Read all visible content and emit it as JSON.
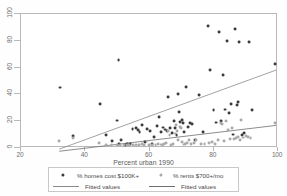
{
  "chart_data": {
    "type": "scatter",
    "title": "",
    "xlabel": "Percent urban 1990",
    "ylabel": "",
    "xlim": [
      20,
      100
    ],
    "ylim": [
      0,
      100
    ],
    "xticks": [
      "20",
      "40",
      "60",
      "80",
      "100"
    ],
    "yticks": [
      "0",
      "20",
      "40",
      "60",
      "80",
      "100"
    ],
    "grid": false,
    "legend_position": "bottom",
    "legend": [
      {
        "label": "% homes cost $100K+",
        "marker": "filled-circle",
        "color": "#3a3a3a"
      },
      {
        "label": "Fitted values",
        "marker": "line",
        "color": "#8a8a8a"
      },
      {
        "label": "% rents $700+/mo",
        "marker": "filled-circle",
        "color": "#a9a9a9"
      },
      {
        "label": "Fitted values",
        "marker": "line",
        "color": "#6f6f6f"
      }
    ],
    "series": [
      {
        "name": "% homes cost $100K+",
        "marker": "filled-circle",
        "color": "#3a3a3a",
        "points": [
          [
            32.2,
            44.3
          ],
          [
            36.2,
            7.6
          ],
          [
            44.8,
            32.0
          ],
          [
            46.8,
            8.5
          ],
          [
            48.5,
            4.0
          ],
          [
            50.2,
            19.3
          ],
          [
            50.6,
            65.3
          ],
          [
            50.9,
            1.2
          ],
          [
            51.4,
            4.6
          ],
          [
            52.6,
            1.0
          ],
          [
            53.4,
            1.5
          ],
          [
            54.2,
            1.2
          ],
          [
            55.0,
            12.6
          ],
          [
            56.0,
            13.9
          ],
          [
            56.6,
            11.9
          ],
          [
            57.2,
            10.6
          ],
          [
            58.1,
            15.8
          ],
          [
            58.8,
            3.0
          ],
          [
            59.6,
            13.1
          ],
          [
            60.4,
            11.0
          ],
          [
            61.0,
            1.2
          ],
          [
            61.8,
            6.5
          ],
          [
            62.6,
            14.8
          ],
          [
            63.2,
            22.0
          ],
          [
            63.9,
            10.5
          ],
          [
            64.6,
            14.0
          ],
          [
            65.2,
            12.5
          ],
          [
            65.8,
            11.4
          ],
          [
            66.2,
            37.2
          ],
          [
            66.8,
            13.5
          ],
          [
            67.3,
            10.0
          ],
          [
            67.9,
            18.6
          ],
          [
            68.4,
            13.7
          ],
          [
            68.8,
            8.5
          ],
          [
            69.2,
            39.3
          ],
          [
            69.6,
            25.6
          ],
          [
            70.0,
            18.4
          ],
          [
            70.4,
            19.5
          ],
          [
            70.8,
            17.6
          ],
          [
            71.2,
            10.6
          ],
          [
            71.8,
            44.8
          ],
          [
            72.4,
            14.4
          ],
          [
            73.0,
            17.5
          ],
          [
            73.8,
            16.4
          ],
          [
            74.6,
            4.5
          ],
          [
            75.8,
            38.7
          ],
          [
            77.0,
            10.8
          ],
          [
            78.8,
            91.0
          ],
          [
            79.4,
            57.6
          ],
          [
            80.4,
            27.3
          ],
          [
            81.2,
            17.8
          ],
          [
            82.2,
            86.6
          ],
          [
            82.8,
            18.6
          ],
          [
            83.4,
            54.0
          ],
          [
            84.0,
            27.6
          ],
          [
            84.6,
            79.2
          ],
          [
            85.2,
            25.2
          ],
          [
            86.0,
            31.5
          ],
          [
            86.4,
            8.7
          ],
          [
            87.2,
            88.8
          ],
          [
            87.8,
            30.8
          ],
          [
            88.0,
            33.4
          ],
          [
            88.4,
            79.0
          ],
          [
            89.4,
            8.2
          ],
          [
            90.0,
            10.0
          ],
          [
            91.6,
            78.6
          ],
          [
            92.4,
            27.5
          ],
          [
            99.6,
            61.8
          ]
        ]
      },
      {
        "name": "% rents $700+/mo",
        "marker": "filled-circle",
        "color": "#a9a9a9",
        "points": [
          [
            32.0,
            3.7
          ],
          [
            36.4,
            5.8
          ],
          [
            44.6,
            2.5
          ],
          [
            46.6,
            1.0
          ],
          [
            48.4,
            0.9
          ],
          [
            50.0,
            0.8
          ],
          [
            51.0,
            0.5
          ],
          [
            52.4,
            0.6
          ],
          [
            53.2,
            0.6
          ],
          [
            54.0,
            0.7
          ],
          [
            55.2,
            0.6
          ],
          [
            56.2,
            0.8
          ],
          [
            57.0,
            1.0
          ],
          [
            58.0,
            1.2
          ],
          [
            58.6,
            0.6
          ],
          [
            59.4,
            3.4
          ],
          [
            60.2,
            0.6
          ],
          [
            61.2,
            0.7
          ],
          [
            62.2,
            1.0
          ],
          [
            63.0,
            1.4
          ],
          [
            63.8,
            1.1
          ],
          [
            64.4,
            0.9
          ],
          [
            65.0,
            1.3
          ],
          [
            65.6,
            2.0
          ],
          [
            66.0,
            11.0
          ],
          [
            66.6,
            8.6
          ],
          [
            67.0,
            1.0
          ],
          [
            67.6,
            1.2
          ],
          [
            68.2,
            9.4
          ],
          [
            68.6,
            16.0
          ],
          [
            69.0,
            11.6
          ],
          [
            69.4,
            4.2
          ],
          [
            69.8,
            14.4
          ],
          [
            70.2,
            13.8
          ],
          [
            70.6,
            3.0
          ],
          [
            71.0,
            1.1
          ],
          [
            71.6,
            1.4
          ],
          [
            72.2,
            2.0
          ],
          [
            72.8,
            4.3
          ],
          [
            73.4,
            1.6
          ],
          [
            74.2,
            2.0
          ],
          [
            75.0,
            4.2
          ],
          [
            76.4,
            1.4
          ],
          [
            77.6,
            1.5
          ],
          [
            79.0,
            2.0
          ],
          [
            80.0,
            3.2
          ],
          [
            81.0,
            1.5
          ],
          [
            81.8,
            4.7
          ],
          [
            82.6,
            17.4
          ],
          [
            83.2,
            16.6
          ],
          [
            83.8,
            4.0
          ],
          [
            84.4,
            19.0
          ],
          [
            85.0,
            11.8
          ],
          [
            85.6,
            5.2
          ],
          [
            86.2,
            13.6
          ],
          [
            86.8,
            5.0
          ],
          [
            87.4,
            6.2
          ],
          [
            88.2,
            7.0
          ],
          [
            88.6,
            4.6
          ],
          [
            89.0,
            19.6
          ],
          [
            89.8,
            6.4
          ],
          [
            90.6,
            7.6
          ],
          [
            91.2,
            6.8
          ],
          [
            92.0,
            5.8
          ],
          [
            99.8,
            17.2
          ]
        ]
      }
    ],
    "fit_lines": [
      {
        "name": "Fitted values",
        "for_series": "% homes cost $100K+",
        "color": "#8a8a8a",
        "x0": 32,
        "y0": -2.4,
        "x1": 100,
        "y1": 57.5
      },
      {
        "name": "Fitted values",
        "for_series": "% rents $700+/mo",
        "color": "#6f6f6f",
        "x0": 32,
        "y0": -4.0,
        "x1": 100,
        "y1": 15.6
      }
    ]
  }
}
